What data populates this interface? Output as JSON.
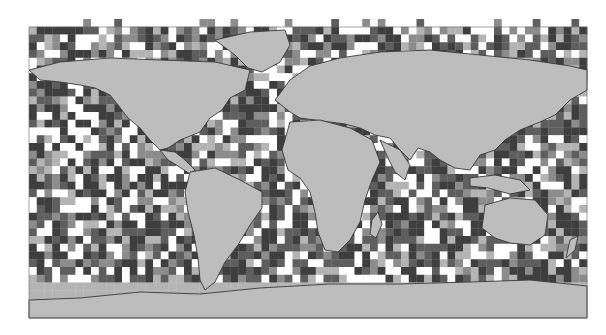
{
  "map": {
    "type": "gridded-world-heatmap",
    "projection": "equirectangular",
    "bounds_px": {
      "x": 29,
      "y": 27,
      "width": 558,
      "height": 291
    },
    "cell_px": 7.75,
    "colors": {
      "background": "#ffffff",
      "land": "#bdbdbd",
      "coast": "#3a3a3a",
      "border": "#4a4a4a",
      "ice": "#d8d8d8",
      "levels": [
        "#ffffff",
        "#b4b4b4",
        "#8c8c8c",
        "#5e5e5e",
        "#3e3e3e"
      ]
    },
    "legend": null,
    "title": null
  }
}
